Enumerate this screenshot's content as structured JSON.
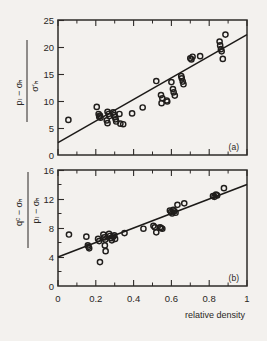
{
  "figure": {
    "xlabel": "relative density",
    "panel_a_label": "(a)",
    "panel_b_label": "(b)",
    "marker": "open-circle",
    "line_color": "#1c1a18",
    "marker_color": "#201e1c",
    "background": "#f3f1ee"
  },
  "panel_a": {
    "ylabel_numerator": "pₗ − σₕ",
    "ylabel_denominator": "σ′ₕ",
    "yticks": [
      "0",
      "5",
      "10",
      "15",
      "20",
      "25"
    ],
    "xticks": [
      "0",
      "0.2",
      "0.4",
      "0.6",
      "0.8",
      "1"
    ]
  },
  "panel_b": {
    "ylabel_numerator": "qᶜ − σₕ",
    "ylabel_denominator": "pₗ − σₕ",
    "yticks": [
      "0",
      "4",
      "8",
      "12",
      "16"
    ],
    "xticks": [
      "0",
      "0.2",
      "0.4",
      "0.6",
      "0.8",
      "1"
    ]
  },
  "chart_data": [
    {
      "type": "scatter",
      "panel": "(a)",
      "title": "",
      "xlabel": "relative density",
      "ylabel": "(p_l - sigma_h) / sigma'_h",
      "xlim": [
        0,
        1
      ],
      "ylim": [
        0,
        25
      ],
      "xticks": [
        0,
        0.1,
        0.2,
        0.3,
        0.4,
        0.5,
        0.6,
        0.7,
        0.8,
        0.9,
        1
      ],
      "xticks_labeled": [
        0,
        0.2,
        0.4,
        0.6,
        0.8,
        1
      ],
      "yticks": [
        0,
        5,
        10,
        15,
        20,
        25
      ],
      "grid": false,
      "legend": "none",
      "marker": "open-circle",
      "points": [
        [
          0.055,
          6.5
        ],
        [
          0.205,
          8.9
        ],
        [
          0.215,
          7.6
        ],
        [
          0.218,
          7.1
        ],
        [
          0.222,
          7.3
        ],
        [
          0.225,
          6.9
        ],
        [
          0.262,
          8.0
        ],
        [
          0.268,
          7.6
        ],
        [
          0.272,
          7.2
        ],
        [
          0.258,
          6.4
        ],
        [
          0.262,
          5.9
        ],
        [
          0.292,
          7.9
        ],
        [
          0.298,
          7.4
        ],
        [
          0.302,
          7.0
        ],
        [
          0.305,
          6.6
        ],
        [
          0.308,
          6.2
        ],
        [
          0.325,
          7.6
        ],
        [
          0.33,
          5.8
        ],
        [
          0.345,
          5.7
        ],
        [
          0.392,
          7.7
        ],
        [
          0.448,
          8.8
        ],
        [
          0.52,
          13.7
        ],
        [
          0.545,
          11.1
        ],
        [
          0.552,
          10.5
        ],
        [
          0.548,
          9.6
        ],
        [
          0.575,
          10.1
        ],
        [
          0.578,
          9.9
        ],
        [
          0.6,
          13.5
        ],
        [
          0.608,
          12.2
        ],
        [
          0.612,
          11.6
        ],
        [
          0.618,
          11.0
        ],
        [
          0.652,
          14.6
        ],
        [
          0.655,
          14.2
        ],
        [
          0.66,
          13.6
        ],
        [
          0.664,
          13.1
        ],
        [
          0.7,
          17.9
        ],
        [
          0.706,
          17.7
        ],
        [
          0.712,
          18.2
        ],
        [
          0.752,
          18.3
        ],
        [
          0.855,
          21.0
        ],
        [
          0.858,
          20.3
        ],
        [
          0.862,
          19.6
        ],
        [
          0.866,
          19.2
        ],
        [
          0.872,
          17.8
        ],
        [
          0.886,
          22.3
        ]
      ],
      "fit_line": {
        "x": [
          0,
          1
        ],
        "y": [
          2.3,
          22.3
        ]
      }
    },
    {
      "type": "scatter",
      "panel": "(b)",
      "title": "",
      "xlabel": "relative density",
      "ylabel": "(q_c - sigma_h) / (p_l - sigma_h)",
      "xlim": [
        0,
        1
      ],
      "ylim": [
        0,
        16
      ],
      "xticks": [
        0,
        0.1,
        0.2,
        0.3,
        0.4,
        0.5,
        0.6,
        0.7,
        0.8,
        0.9,
        1
      ],
      "xticks_labeled": [
        0,
        0.2,
        0.4,
        0.6,
        0.8,
        1
      ],
      "yticks": [
        0,
        4,
        8,
        12,
        16
      ],
      "grid": false,
      "legend": "none",
      "marker": "open-circle",
      "points": [
        [
          0.058,
          7.1
        ],
        [
          0.15,
          6.8
        ],
        [
          0.158,
          5.6
        ],
        [
          0.162,
          5.4
        ],
        [
          0.165,
          5.2
        ],
        [
          0.212,
          6.5
        ],
        [
          0.218,
          6.2
        ],
        [
          0.222,
          3.3
        ],
        [
          0.24,
          7.1
        ],
        [
          0.245,
          6.7
        ],
        [
          0.25,
          6.4
        ],
        [
          0.248,
          5.6
        ],
        [
          0.252,
          4.8
        ],
        [
          0.27,
          7.2
        ],
        [
          0.275,
          6.9
        ],
        [
          0.28,
          6.6
        ],
        [
          0.285,
          6.3
        ],
        [
          0.292,
          6.8
        ],
        [
          0.298,
          7.0
        ],
        [
          0.302,
          6.5
        ],
        [
          0.352,
          7.3
        ],
        [
          0.452,
          7.9
        ],
        [
          0.505,
          8.3
        ],
        [
          0.512,
          8.1
        ],
        [
          0.52,
          7.4
        ],
        [
          0.54,
          8.1
        ],
        [
          0.546,
          8.0
        ],
        [
          0.552,
          7.9
        ],
        [
          0.592,
          10.4
        ],
        [
          0.598,
          10.2
        ],
        [
          0.604,
          10.0
        ],
        [
          0.61,
          10.5
        ],
        [
          0.616,
          10.3
        ],
        [
          0.622,
          10.1
        ],
        [
          0.632,
          11.2
        ],
        [
          0.668,
          11.4
        ],
        [
          0.82,
          12.4
        ],
        [
          0.828,
          12.3
        ],
        [
          0.836,
          12.6
        ],
        [
          0.842,
          12.5
        ],
        [
          0.878,
          13.5
        ]
      ],
      "fit_line": {
        "x": [
          0,
          1
        ],
        "y": [
          4.0,
          14.0
        ]
      }
    }
  ]
}
